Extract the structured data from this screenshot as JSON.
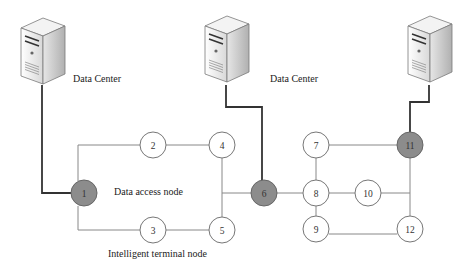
{
  "labels": {
    "data_center_left": "Data Center",
    "data_center_middle": "Data Center",
    "data_access_node": "Data access node",
    "intelligent_terminal_node": "Intelligent terminal node"
  },
  "nodes": [
    {
      "id": "1",
      "type": "data-access",
      "fill": "#8c8c8c"
    },
    {
      "id": "2",
      "type": "terminal",
      "fill": "#ffffff"
    },
    {
      "id": "3",
      "type": "terminal",
      "fill": "#ffffff"
    },
    {
      "id": "4",
      "type": "terminal",
      "fill": "#ffffff"
    },
    {
      "id": "5",
      "type": "terminal",
      "fill": "#ffffff"
    },
    {
      "id": "6",
      "type": "data-access",
      "fill": "#8c8c8c"
    },
    {
      "id": "7",
      "type": "terminal",
      "fill": "#ffffff"
    },
    {
      "id": "8",
      "type": "terminal",
      "fill": "#ffffff"
    },
    {
      "id": "9",
      "type": "terminal",
      "fill": "#ffffff"
    },
    {
      "id": "10",
      "type": "terminal",
      "fill": "#ffffff"
    },
    {
      "id": "11",
      "type": "data-access",
      "fill": "#8c8c8c"
    },
    {
      "id": "12",
      "type": "terminal",
      "fill": "#ffffff"
    }
  ],
  "edges": [
    [
      "1",
      "2"
    ],
    [
      "1",
      "3"
    ],
    [
      "2",
      "4"
    ],
    [
      "3",
      "5"
    ],
    [
      "4",
      "5"
    ],
    [
      "4",
      "6"
    ],
    [
      "5",
      "6"
    ],
    [
      "6",
      "8"
    ],
    [
      "7",
      "8"
    ],
    [
      "8",
      "9"
    ],
    [
      "8",
      "10"
    ],
    [
      "7",
      "11"
    ],
    [
      "10",
      "11"
    ],
    [
      "11",
      "12"
    ],
    [
      "9",
      "12"
    ]
  ],
  "servers": [
    {
      "name": "data-center-left",
      "connects_to": "1"
    },
    {
      "name": "data-center-middle",
      "connects_to": "6"
    },
    {
      "name": "data-center-right",
      "connects_to": "11"
    }
  ],
  "colors": {
    "access_node": "#8c8c8c",
    "terminal_node": "#ffffff",
    "thin_link": "#777777",
    "thick_link": "#333333"
  }
}
